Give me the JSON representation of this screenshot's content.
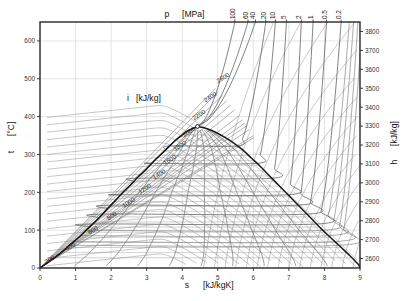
{
  "chart_data": {
    "type": "line",
    "title": "",
    "subtitle": "",
    "xlabel": "s",
    "xunit": "[kJ/kgK]",
    "ylabel": "t",
    "yunit": "[°C]",
    "y2label": "h",
    "y2unit": "[kJ/kg]",
    "toplabel": "p",
    "topunit": "[MPa]",
    "innerlabel": "i",
    "innerunit": "[kJ/kg]",
    "xlim": [
      0,
      9
    ],
    "ylim": [
      0,
      650
    ],
    "y2lim": [
      2550,
      3850
    ],
    "grid": true,
    "legend_position": "none",
    "x_ticks": [
      "0",
      "1",
      "2",
      "3",
      "4",
      "5",
      "6",
      "7",
      "8",
      "9"
    ],
    "x_tick_values": [
      0,
      1,
      2,
      3,
      4,
      5,
      6,
      7,
      8,
      9
    ],
    "y_ticks": [
      "0",
      "100",
      "200",
      "300",
      "400",
      "500",
      "600"
    ],
    "y_tick_values": [
      0,
      100,
      200,
      300,
      400,
      500,
      600
    ],
    "y2_ticks": [
      "2600",
      "2700",
      "2800",
      "2900",
      "3000",
      "3100",
      "3200",
      "3300",
      "3400",
      "3500",
      "3600",
      "3700",
      "3800"
    ],
    "y2_tick_values": [
      2600,
      2700,
      2800,
      2900,
      3000,
      3100,
      3200,
      3300,
      3400,
      3500,
      3600,
      3700,
      3800
    ],
    "pressure_labels": [
      "100",
      "60",
      "40",
      "20",
      "10",
      "5",
      "2",
      "1",
      "0.5",
      "0.2"
    ],
    "pressure_values": [
      100,
      60,
      40,
      20,
      10,
      5,
      2,
      1,
      0.5,
      0.2
    ],
    "pressure_label_x": [
      5.48,
      5.85,
      6.06,
      6.35,
      6.62,
      6.93,
      7.35,
      7.68,
      8.06,
      8.47
    ],
    "enthalpy_labels": [
      "200",
      "400",
      "600",
      "800",
      "1000",
      "1200",
      "1400",
      "1600",
      "1800",
      "2000",
      "2200",
      "2400",
      "2600"
    ],
    "enthalpy_values": [
      200,
      400,
      600,
      800,
      1000,
      1200,
      1400,
      1600,
      1800,
      2000,
      2200,
      2400,
      2600
    ],
    "enthalpy_label_pos": [
      [
        0.3,
        18
      ],
      [
        0.88,
        52
      ],
      [
        1.52,
        95
      ],
      [
        2.05,
        133
      ],
      [
        2.52,
        168
      ],
      [
        2.98,
        205
      ],
      [
        3.38,
        243
      ],
      [
        3.68,
        281
      ],
      [
        3.96,
        318
      ],
      [
        4.22,
        355
      ],
      [
        4.5,
        400
      ],
      [
        4.82,
        447
      ],
      [
        5.18,
        498
      ]
    ],
    "critical_point": {
      "s": 4.43,
      "t": 374
    },
    "saturation_dome": {
      "liquid": [
        [
          0.0,
          0
        ],
        [
          0.3,
          20
        ],
        [
          0.59,
          40
        ],
        [
          0.83,
          60
        ],
        [
          1.08,
          80
        ],
        [
          1.3,
          100
        ],
        [
          1.53,
          120
        ],
        [
          1.74,
          140
        ],
        [
          1.93,
          160
        ],
        [
          2.14,
          180
        ],
        [
          2.33,
          200
        ],
        [
          2.55,
          220
        ],
        [
          2.75,
          240
        ],
        [
          2.98,
          260
        ],
        [
          3.18,
          280
        ],
        [
          3.4,
          300
        ],
        [
          3.62,
          320
        ],
        [
          3.78,
          335
        ],
        [
          3.98,
          350
        ],
        [
          4.15,
          362
        ],
        [
          4.43,
          374
        ]
      ],
      "vapor": [
        [
          4.43,
          374
        ],
        [
          4.7,
          368
        ],
        [
          4.95,
          358
        ],
        [
          5.2,
          345
        ],
        [
          5.45,
          330
        ],
        [
          5.7,
          312
        ],
        [
          5.95,
          290
        ],
        [
          6.2,
          268
        ],
        [
          6.45,
          244
        ],
        [
          6.7,
          220
        ],
        [
          6.95,
          196
        ],
        [
          7.2,
          172
        ],
        [
          7.45,
          148
        ],
        [
          7.7,
          124
        ],
        [
          7.95,
          100
        ],
        [
          8.2,
          78
        ],
        [
          8.45,
          56
        ],
        [
          8.7,
          34
        ],
        [
          8.95,
          10
        ],
        [
          9.0,
          0
        ]
      ]
    },
    "quality_lines": [
      0.1,
      0.2,
      0.3,
      0.4,
      0.5,
      0.6,
      0.7,
      0.8,
      0.9
    ],
    "isobar_count": 10,
    "isenthalp_count": 13,
    "colors": {
      "background": "#ffffff",
      "frame": "#2a2a2a",
      "grid": "#d8d8d8",
      "dome": "#1a1a1a",
      "isobar": "#5a5a5a",
      "isenthalp": "#8c8c8c",
      "quality": "#707070",
      "text": "#1a1a1a"
    }
  }
}
